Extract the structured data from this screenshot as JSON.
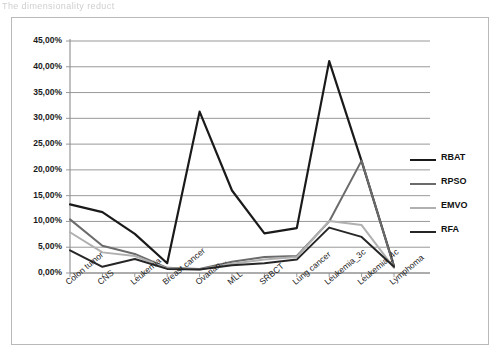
{
  "page": {
    "top_partial_text": "The dimensionality reduct"
  },
  "chart_data": {
    "type": "line",
    "title": "",
    "subtitle": "",
    "xlabel": "",
    "ylabel": "",
    "ylim": [
      0,
      45
    ],
    "ytick_step": 5,
    "ytick_labels": [
      "0,00%",
      "5,00%",
      "10,00%",
      "15,00%",
      "20,00%",
      "25,00%",
      "30,00%",
      "35,00%",
      "40,00%",
      "45,00%"
    ],
    "ytick_values": [
      0,
      5,
      10,
      15,
      20,
      25,
      30,
      35,
      40,
      45
    ],
    "grid": true,
    "grid_axis": "y",
    "legend_position": "right",
    "categories": [
      "Colon tumor",
      "CNS",
      "Leukemia",
      "Breast cancer",
      "Ovarian...",
      "MLL",
      "SRBCT",
      "Lung cancer",
      "Leukemia_3c",
      "Leukemia_4c",
      "Lymphoma"
    ],
    "series": [
      {
        "name": "RBAT",
        "color": "#1a1a1a",
        "width": 2.2,
        "values": [
          13.3,
          11.8,
          7.6,
          1.9,
          31.3,
          16.0,
          7.7,
          8.7,
          41.1,
          21.7,
          1.3
        ]
      },
      {
        "name": "RPSO",
        "color": "#6b6b6b",
        "width": 2.0,
        "values": [
          10.4,
          5.3,
          3.7,
          1.0,
          0.8,
          2.2,
          3.1,
          3.3,
          10.0,
          21.8,
          1.2
        ]
      },
      {
        "name": "EMVO",
        "color": "#b0b0b0",
        "width": 2.0,
        "values": [
          7.9,
          4.0,
          3.3,
          0.9,
          0.7,
          1.8,
          2.6,
          3.1,
          10.1,
          9.3,
          1.0
        ]
      },
      {
        "name": "RFA",
        "color": "#262626",
        "width": 2.0,
        "values": [
          4.4,
          1.2,
          2.7,
          0.8,
          0.7,
          1.5,
          1.9,
          2.6,
          8.8,
          7.0,
          1.2
        ]
      }
    ]
  }
}
